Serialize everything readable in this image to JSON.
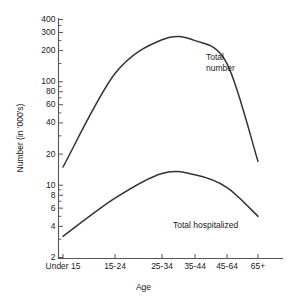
{
  "chart_data": {
    "type": "line",
    "title": "",
    "xlabel": "Age",
    "ylabel": "Number (in '000's)",
    "yscale": "log",
    "ylim": [
      2,
      400
    ],
    "grid": false,
    "legend_position": "inline-annotation",
    "categories": [
      "Under 15",
      "15-24",
      "25-34",
      "35-44",
      "45-64",
      "65+"
    ],
    "ytick_labels": [
      "400",
      "300",
      "200",
      "100",
      "80",
      "60",
      "40",
      "20",
      "10",
      "8",
      "6",
      "4",
      "2"
    ],
    "ytick_values": [
      400,
      300,
      200,
      100,
      80,
      60,
      40,
      20,
      10,
      8,
      6,
      4,
      2
    ],
    "series": [
      {
        "name": "Total number",
        "values": [
          15,
          120,
          255,
          250,
          150,
          17
        ]
      },
      {
        "name": "Total hospitalized",
        "values": [
          3.2,
          7.5,
          13,
          12.6,
          9.5,
          5
        ]
      }
    ]
  },
  "annotations": {
    "total_number_line1": "Total",
    "total_number_line2": "number",
    "total_hospitalized": "Total hospitalized"
  },
  "colors": {
    "line": "#333333",
    "axis": "#555555",
    "text": "#1a1a1a",
    "background": "#ffffff"
  }
}
